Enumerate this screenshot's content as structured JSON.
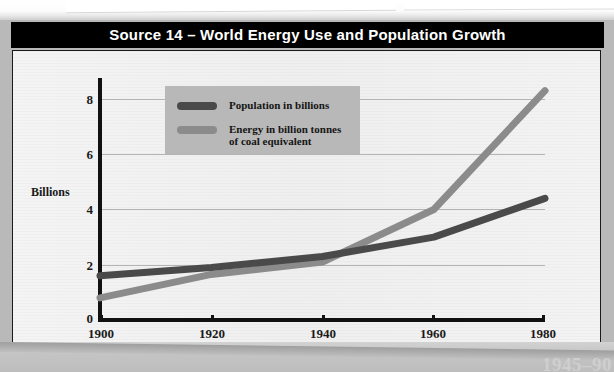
{
  "figure": {
    "title": "Source 14 – World Energy Use and Population Growth",
    "footer_note": "1945–90"
  },
  "legend": {
    "items": [
      {
        "label": "Population in billions",
        "color": "#4a4a4a"
      },
      {
        "label": "Energy in billion tonnes\nof coal equivalent",
        "color": "#8b8b8b"
      }
    ]
  },
  "chart_data": {
    "type": "line",
    "title": "Source 14 – World Energy Use and Population Growth",
    "xlabel": "",
    "ylabel": "Billions",
    "x": [
      1900,
      1920,
      1940,
      1960,
      1980
    ],
    "xticks": [
      "1900",
      "1920",
      "1940",
      "1960",
      "1980"
    ],
    "yticks": [
      "0",
      "2",
      "4",
      "6",
      "8"
    ],
    "xlim": [
      1900,
      1980
    ],
    "ylim": [
      0,
      8.6
    ],
    "grid": true,
    "legend_position": "upper-left-inside",
    "series": [
      {
        "name": "Population in billions",
        "color": "#4a4a4a",
        "values": [
          1.6,
          1.9,
          2.3,
          3.0,
          4.4
        ]
      },
      {
        "name": "Energy in billion tonnes of coal equivalent",
        "color": "#8b8b8b",
        "values": [
          0.8,
          1.65,
          2.1,
          4.0,
          8.3
        ]
      }
    ]
  }
}
